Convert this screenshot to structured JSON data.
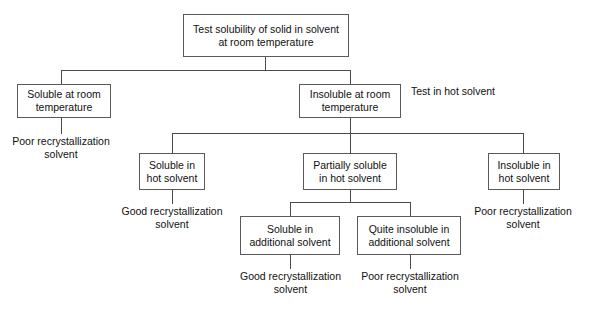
{
  "diagram": {
    "type": "flowchart",
    "line_color": "#4a4a4a",
    "box_border_color": "#5a5a5a",
    "text_color": "#111111",
    "background": "#ffffff"
  },
  "nodes": {
    "root": {
      "line1": "Test solubility of solid in solvent",
      "line2": "at room temperature"
    },
    "soluble_rt": {
      "line1": "Soluble at room",
      "line2": "temperature"
    },
    "insoluble_rt": {
      "line1": "Insoluble at room",
      "line2": "temperature"
    },
    "soluble_hot": {
      "line1": "Soluble in",
      "line2": "hot solvent"
    },
    "partially_soluble_hot": {
      "line1": "Partially soluble",
      "line2": "in hot solvent"
    },
    "insoluble_hot": {
      "line1": "Insoluble in",
      "line2": "hot solvent"
    },
    "soluble_additional": {
      "line1": "Soluble in",
      "line2": "additional solvent"
    },
    "quite_insoluble_additional": {
      "line1": "Quite insoluble in",
      "line2": "additional solvent"
    }
  },
  "annotations": {
    "test_hot_solvent": {
      "line1": "Test in",
      "line2": "hot solvent"
    }
  },
  "outcomes": {
    "poor_from_soluble_rt": {
      "line1": "Poor recrystallization",
      "line2": "solvent"
    },
    "good_from_soluble_hot": {
      "line1": "Good recrystallization",
      "line2": "solvent"
    },
    "poor_from_insoluble_hot": {
      "line1": "Poor recrystallization",
      "line2": "solvent"
    },
    "good_from_soluble_additional": {
      "line1": "Good recrystallization",
      "line2": "solvent"
    },
    "poor_from_quite_insoluble_additional": {
      "line1": "Poor recrystallization",
      "line2": "solvent"
    }
  }
}
